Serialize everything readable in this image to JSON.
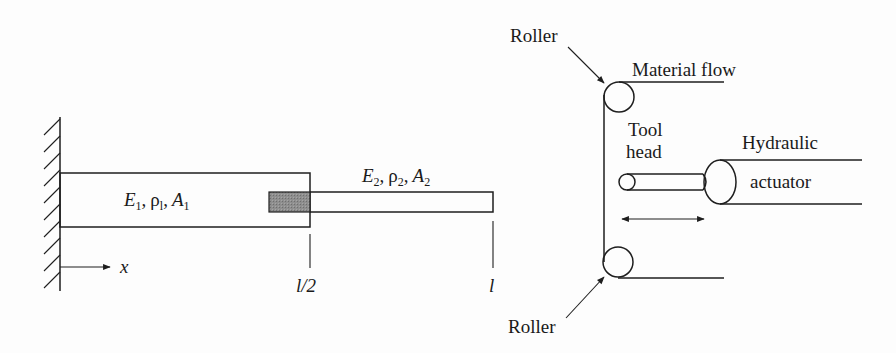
{
  "figure": {
    "background_color": "#fdfdfd",
    "line_color": "#1e1e1e",
    "overlap_fill_color": "#8a8a8a"
  },
  "beam_diagram": {
    "support": "fixed-wall",
    "segment1": {
      "E": "E",
      "E_sub": "1",
      "rho": "ρ",
      "rho_sub": "l",
      "A": "A",
      "A_sub": "1",
      "sep": ","
    },
    "segment2": {
      "E": "E",
      "E_sub": "2",
      "rho": "ρ",
      "rho_sub": "2",
      "A": "A",
      "A_sub": "2",
      "sep": ","
    },
    "axis_label": "x",
    "mark_half": "l/2",
    "mark_end": "l"
  },
  "machine_diagram": {
    "roller_top_label": "Roller",
    "roller_bottom_label": "Roller",
    "material_flow_label": "Material flow",
    "tool_head_label_line1": "Tool",
    "tool_head_label_line2": "head",
    "actuator_label_line1": "Hydraulic",
    "actuator_label_line2": "actuator"
  }
}
